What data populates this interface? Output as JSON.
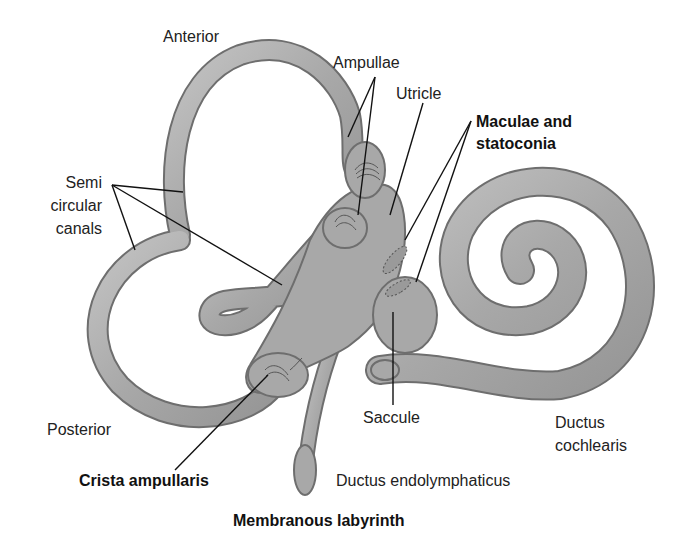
{
  "figure": {
    "title": "Membranous labyrinth",
    "colors": {
      "tissue_fill": "#a9a9a9",
      "tissue_highlight": "#cfcfcf",
      "tissue_outline": "#6e6e6e",
      "leader_line": "#111111",
      "background": "#ffffff"
    }
  },
  "labels": {
    "anterior": "Anterior",
    "ampullae": "Ampullae",
    "utricle": "Utricle",
    "maculae_line1": "Maculae and",
    "maculae_line2": "statoconia",
    "semi_line1": "Semi",
    "semi_line2": "circular",
    "semi_line3": "canals",
    "posterior": "Posterior",
    "saccule": "Saccule",
    "ductus_cochlearis_line1": "Ductus",
    "ductus_cochlearis_line2": "cochlearis",
    "crista_ampullaris": "Crista ampullaris",
    "ductus_endolymphaticus": "Ductus endolymphaticus"
  }
}
